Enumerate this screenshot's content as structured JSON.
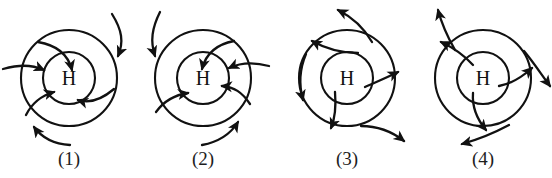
{
  "figure": {
    "caption_fragment_top": "",
    "background_color": "#ffffff",
    "ink_color": "#111111",
    "center_label": "H",
    "panel_count": 4
  },
  "panels": [
    {
      "id": "panel-1",
      "label": "(1)",
      "center_label": "H",
      "rotation": "clockwise",
      "radial_flow": "inward",
      "description": "Clockwise inward spiral around a high-pressure center",
      "outer_radius": 48,
      "inner_radius": 26,
      "arrow_count_outer": 3,
      "arrow_count_inner": 3
    },
    {
      "id": "panel-2",
      "label": "(2)",
      "center_label": "H",
      "rotation": "counterclockwise",
      "radial_flow": "inward",
      "description": "Counterclockwise inward spiral around a high-pressure center",
      "outer_radius": 48,
      "inner_radius": 26,
      "arrow_count_outer": 3,
      "arrow_count_inner": 3
    },
    {
      "id": "panel-3",
      "label": "(3)",
      "center_label": "H",
      "rotation": "clockwise",
      "radial_flow": "outward",
      "description": "Clockwise outward spiral away from a high-pressure center",
      "outer_radius": 48,
      "inner_radius": 26,
      "arrow_count_outer": 3,
      "arrow_count_inner": 3
    },
    {
      "id": "panel-4",
      "label": "(4)",
      "center_label": "H",
      "rotation": "counterclockwise",
      "radial_flow": "outward",
      "description": "Counterclockwise outward spiral away from a high-pressure center",
      "outer_radius": 48,
      "inner_radius": 26,
      "arrow_count_outer": 3,
      "arrow_count_inner": 3
    }
  ]
}
